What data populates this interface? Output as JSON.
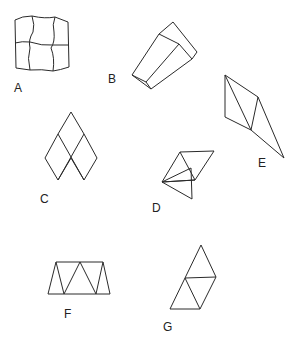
{
  "figure": {
    "labels": {
      "a": "A",
      "b": "B",
      "c": "C",
      "d": "D",
      "e": "E",
      "f": "F",
      "g": "G"
    },
    "colors": {
      "stroke": "#2a2a2a",
      "background": "#ffffff",
      "text": "#222222"
    }
  }
}
